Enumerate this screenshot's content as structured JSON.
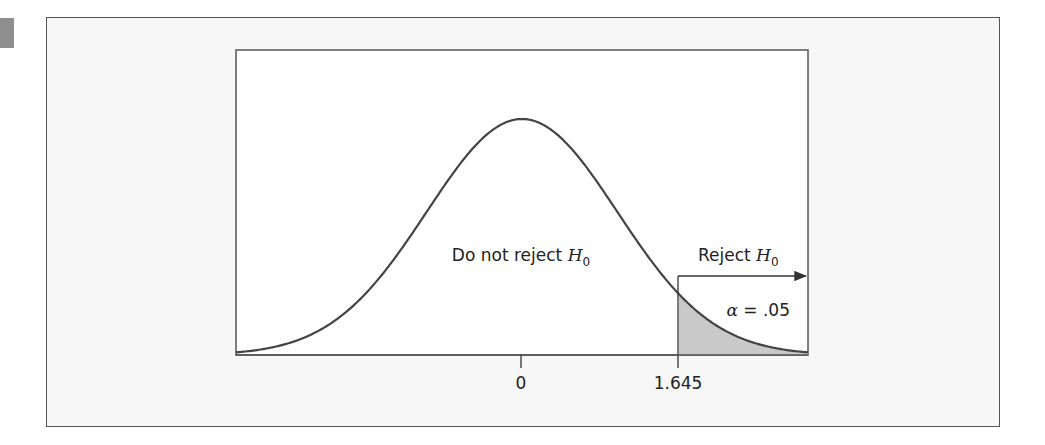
{
  "chart_data": {
    "type": "area",
    "title": "",
    "xlabel": "",
    "ylabel": "",
    "x_range": [
      -3,
      3
    ],
    "distribution": {
      "name": "standard normal",
      "mean": 0,
      "sd": 1
    },
    "critical_value": 1.645,
    "tick_labels": [
      "0",
      "1.645"
    ],
    "tick_values": [
      0,
      1.645
    ],
    "regions": [
      {
        "name": "acceptance",
        "label": "Do not reject",
        "hypothesis": "H",
        "subscript": "0",
        "x_range": [
          -3,
          1.645
        ]
      },
      {
        "name": "rejection",
        "label": "Reject",
        "hypothesis": "H",
        "subscript": "0",
        "x_range": [
          1.645,
          3
        ],
        "shaded": true
      }
    ],
    "annotations": {
      "alpha_symbol": "α",
      "alpha_text": " = .05",
      "alpha": 0.05
    },
    "grid": false,
    "legend": null,
    "colors": {
      "curve": "#444444",
      "shade": "#c9c9c9",
      "frame": "#555555",
      "figure_bg": "#f7f7f7",
      "plot_bg": "#ffffff"
    }
  },
  "labels": {
    "do_not_reject": "Do not reject ",
    "reject": "Reject ",
    "h": "H",
    "sub0": "0",
    "tick_zero": "0",
    "tick_crit": "1.645",
    "alpha_symbol": "α",
    "alpha_text": " = .05"
  }
}
